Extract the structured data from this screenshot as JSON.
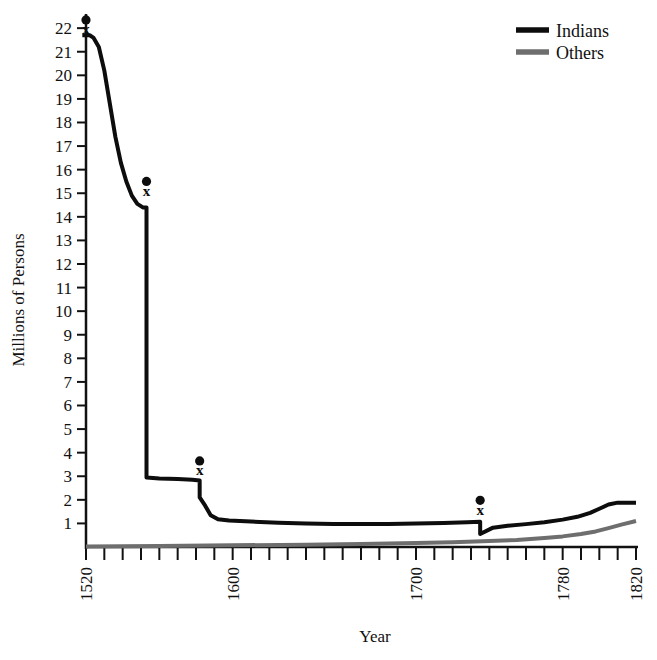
{
  "chart_data": {
    "type": "line",
    "title": "",
    "xlabel": "Year",
    "ylabel": "Millions of Persons",
    "xlim": [
      1520,
      1820
    ],
    "ylim": [
      0,
      22.6
    ],
    "grid": false,
    "legend_position": "top-right",
    "x_ticks_major": [
      "1520",
      "1600",
      "1700",
      "1780",
      "1820"
    ],
    "x_tick_values_major": [
      1520,
      1600,
      1700,
      1780,
      1820
    ],
    "x_tick_step_minor": 10,
    "y_ticks": [
      "1",
      "2",
      "3",
      "4",
      "5",
      "6",
      "7",
      "8",
      "9",
      "10",
      "11",
      "12",
      "13",
      "14",
      "15",
      "16",
      "17",
      "18",
      "19",
      "20",
      "21",
      "22"
    ],
    "y_tick_values": [
      1,
      2,
      3,
      4,
      5,
      6,
      7,
      8,
      9,
      10,
      11,
      12,
      13,
      14,
      15,
      16,
      17,
      18,
      19,
      20,
      21,
      22
    ],
    "series": [
      {
        "name": "Indians",
        "color": "#0d0d0d",
        "width": 4,
        "points": [
          [
            1518,
            21.7
          ],
          [
            1522,
            21.7
          ],
          [
            1524,
            21.6
          ],
          [
            1527,
            21.2
          ],
          [
            1530,
            20.2
          ],
          [
            1533,
            18.8
          ],
          [
            1536,
            17.4
          ],
          [
            1539,
            16.3
          ],
          [
            1542,
            15.5
          ],
          [
            1545,
            14.9
          ],
          [
            1548,
            14.55
          ],
          [
            1551,
            14.4
          ],
          [
            1553,
            14.4
          ],
          [
            1553,
            2.95
          ],
          [
            1560,
            2.9
          ],
          [
            1570,
            2.88
          ],
          [
            1578,
            2.85
          ],
          [
            1582,
            2.82
          ],
          [
            1582,
            2.1
          ],
          [
            1585,
            1.75
          ],
          [
            1588,
            1.35
          ],
          [
            1592,
            1.18
          ],
          [
            1598,
            1.12
          ],
          [
            1610,
            1.08
          ],
          [
            1625,
            1.03
          ],
          [
            1640,
            1.0
          ],
          [
            1655,
            0.98
          ],
          [
            1670,
            0.97
          ],
          [
            1685,
            0.98
          ],
          [
            1700,
            1.0
          ],
          [
            1715,
            1.02
          ],
          [
            1728,
            1.05
          ],
          [
            1735,
            1.07
          ],
          [
            1735,
            0.55
          ],
          [
            1742,
            0.82
          ],
          [
            1750,
            0.9
          ],
          [
            1760,
            0.97
          ],
          [
            1770,
            1.05
          ],
          [
            1780,
            1.16
          ],
          [
            1788,
            1.28
          ],
          [
            1795,
            1.45
          ],
          [
            1800,
            1.62
          ],
          [
            1805,
            1.8
          ],
          [
            1810,
            1.88
          ],
          [
            1820,
            1.88
          ]
        ]
      },
      {
        "name": "Others",
        "color": "#6e6e6e",
        "width": 4,
        "points": [
          [
            1520,
            0.02
          ],
          [
            1560,
            0.04
          ],
          [
            1600,
            0.07
          ],
          [
            1640,
            0.1
          ],
          [
            1670,
            0.13
          ],
          [
            1700,
            0.17
          ],
          [
            1720,
            0.2
          ],
          [
            1740,
            0.25
          ],
          [
            1755,
            0.3
          ],
          [
            1770,
            0.38
          ],
          [
            1780,
            0.45
          ],
          [
            1790,
            0.55
          ],
          [
            1798,
            0.66
          ],
          [
            1805,
            0.8
          ],
          [
            1812,
            0.95
          ],
          [
            1820,
            1.1
          ]
        ]
      }
    ],
    "annotations": [
      {
        "label": "x",
        "marker": "dot-over-x",
        "x": 1520,
        "y": 22.35,
        "y_x": 21.95
      },
      {
        "label": "x",
        "marker": "dot-over-x",
        "x": 1553,
        "y": 15.5,
        "y_x": 15.1
      },
      {
        "label": "x",
        "marker": "dot-over-x",
        "x": 1582,
        "y": 3.65,
        "y_x": 3.25
      },
      {
        "label": "x",
        "marker": "dot-over-x",
        "x": 1735,
        "y": 1.98,
        "y_x": 1.58
      }
    ]
  },
  "legend": {
    "items": [
      {
        "label": "Indians",
        "color": "#0d0d0d"
      },
      {
        "label": "Others",
        "color": "#6e6e6e"
      }
    ]
  },
  "axes": {
    "x_title": "Year",
    "y_title": "Millions of Persons"
  }
}
